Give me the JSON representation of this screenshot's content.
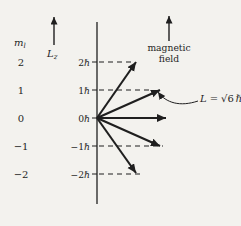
{
  "colors": {
    "paper": "#f3f2ee",
    "ink": "#1f1f1f"
  },
  "left_axis": {
    "ml_symbol": "m",
    "ml_subscript": "l",
    "lz_symbol": "L",
    "lz_subscript": "z"
  },
  "levels": [
    {
      "ml": "2",
      "lz": "2ℏ"
    },
    {
      "ml": "1",
      "lz": "1ℏ"
    },
    {
      "ml": "0",
      "lz": "0ℏ"
    },
    {
      "ml": "−1",
      "lz": "−1ℏ"
    },
    {
      "ml": "−2",
      "lz": "−2ℏ"
    }
  ],
  "magnetic_field": {
    "line1": "magnetic",
    "line2": "field"
  },
  "vector_label": {
    "symbol": "L",
    "equals": "=",
    "value": "√6",
    "hbar": "ℏ"
  }
}
